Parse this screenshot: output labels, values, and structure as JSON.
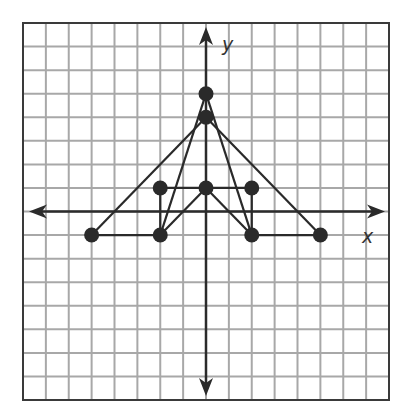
{
  "diagram": {
    "type": "coordinate-grid-figure",
    "grid": {
      "columns": 16,
      "rows": 16,
      "x_range": [
        -8,
        8
      ],
      "y_range": [
        -8,
        8
      ],
      "line_color": "#a8a8a8",
      "border_color": "#3a3a3a"
    },
    "axes": {
      "x_label": "x",
      "y_label": "y",
      "color": "#2b2b2b",
      "arrows": "both-ends"
    },
    "points": [
      {
        "id": "A",
        "x": 0,
        "y": 5
      },
      {
        "id": "B",
        "x": 0,
        "y": 4
      },
      {
        "id": "C",
        "x": -2,
        "y": 1
      },
      {
        "id": "D",
        "x": 0,
        "y": 1
      },
      {
        "id": "E",
        "x": 2,
        "y": 1
      },
      {
        "id": "F",
        "x": -5,
        "y": -1
      },
      {
        "id": "G",
        "x": -2,
        "y": -1
      },
      {
        "id": "H",
        "x": 2,
        "y": -1
      },
      {
        "id": "I",
        "x": 5,
        "y": -1
      }
    ],
    "segments": [
      [
        "C",
        "D"
      ],
      [
        "D",
        "E"
      ],
      [
        "C",
        "G"
      ],
      [
        "E",
        "H"
      ],
      [
        "D",
        "G"
      ],
      [
        "D",
        "H"
      ],
      [
        "F",
        "G"
      ],
      [
        "H",
        "I"
      ],
      [
        "B",
        "F"
      ],
      [
        "B",
        "I"
      ],
      [
        "A",
        "G"
      ],
      [
        "A",
        "H"
      ]
    ],
    "point_color": "#2a2a2a",
    "segment_color": "#2a2a2a"
  }
}
